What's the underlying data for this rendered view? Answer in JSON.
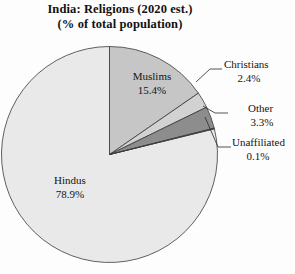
{
  "title": {
    "line1": "India: Religions (2020 est.)",
    "line2": "(% of total population)"
  },
  "chart_data": {
    "type": "pie",
    "title": "India: Religions (2020 est.) (% of total population)",
    "subtitle": "(% of total population)",
    "units": "percent of total population",
    "start_angle_deg": 0,
    "direction": "clockwise",
    "categories": [
      "Muslims",
      "Christians",
      "Other",
      "Unaffiliated",
      "Hindus"
    ],
    "values": [
      15.4,
      2.4,
      3.3,
      0.1,
      78.9
    ],
    "slices": [
      {
        "label": "Muslims",
        "value": 15.4,
        "value_text": "15.4%",
        "color": "#c6c6c6",
        "label_placement": "inside"
      },
      {
        "label": "Christians",
        "value": 2.4,
        "value_text": "2.4%",
        "color": "#d2d2d2",
        "label_placement": "callout-right"
      },
      {
        "label": "Other",
        "value": 3.3,
        "value_text": "3.3%",
        "color": "#8d8d8d",
        "label_placement": "callout-right"
      },
      {
        "label": "Unaffiliated",
        "value": 0.1,
        "value_text": "0.1%",
        "color": "#6f6f6f",
        "label_placement": "callout-right"
      },
      {
        "label": "Hindus",
        "value": 78.9,
        "value_text": "78.9%",
        "color": "#e9e9e9",
        "label_placement": "inside"
      }
    ],
    "legend": "none",
    "grid": false
  },
  "labels": {
    "muslims_name": "Muslims",
    "muslims_value": "15.4%",
    "hindus_name": "Hindus",
    "hindus_value": "78.9%",
    "christians_name": "Christians",
    "christians_value": "2.4%",
    "other_name": "Other",
    "other_value": "3.3%",
    "unaffiliated_name": "Unaffiliated",
    "unaffiliated_value": "0.1%"
  },
  "colors": {
    "hindus": "#e9e9e9",
    "muslims": "#c6c6c6",
    "christians": "#d2d2d2",
    "other": "#8d8d8d",
    "unaffiliated": "#6f6f6f",
    "outline": "#3a3a3a",
    "background": "#fdfdfd",
    "text": "#141414"
  }
}
